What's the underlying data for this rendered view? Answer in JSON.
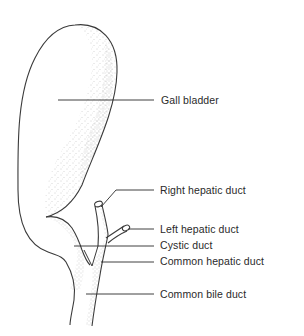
{
  "diagram": {
    "colors": {
      "outline": "#3a3a3a",
      "stipple": "#8a8a8a",
      "leader": "#2a2a2a",
      "text": "#2a2a2a",
      "background": "#ffffff"
    },
    "labels": [
      {
        "id": "gall-bladder",
        "text": "Gall bladder"
      },
      {
        "id": "right-hepatic-duct",
        "text": "Right hepatic duct"
      },
      {
        "id": "left-hepatic-duct",
        "text": "Left hepatic duct"
      },
      {
        "id": "cystic-duct",
        "text": "Cystic duct"
      },
      {
        "id": "common-hepatic-duct",
        "text": "Common hepatic duct"
      },
      {
        "id": "common-bile-duct",
        "text": "Common bile duct"
      }
    ]
  }
}
